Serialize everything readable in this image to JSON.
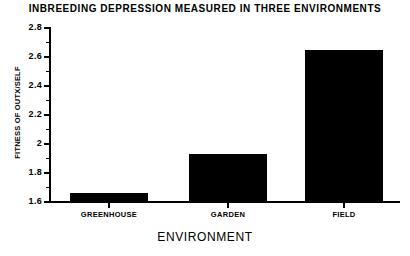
{
  "chart_data": {
    "type": "bar",
    "title": "INBREEDING DEPRESSION MEASURED IN THREE ENVIRONMENTS",
    "xlabel": "ENVIRONMENT",
    "ylabel": "FITNESS OF OUTX/SELF",
    "categories": [
      "GREENHOUSE",
      "GARDEN",
      "FIELD"
    ],
    "values": [
      1.66,
      1.93,
      2.65
    ],
    "ylim": [
      1.6,
      2.8
    ],
    "ytick_labels": [
      "2.8",
      "2.6",
      "2.4",
      "2.2",
      "2",
      "1.8",
      "1.6"
    ],
    "ytick_values": [
      2.8,
      2.6,
      2.4,
      2.2,
      2.0,
      1.8,
      1.6
    ],
    "yminor_values": [
      2.7,
      2.5,
      2.3,
      2.1,
      1.9,
      1.7
    ],
    "grid": false,
    "legend": null,
    "bar_color": "#000000",
    "background_color": "#ffffff"
  }
}
